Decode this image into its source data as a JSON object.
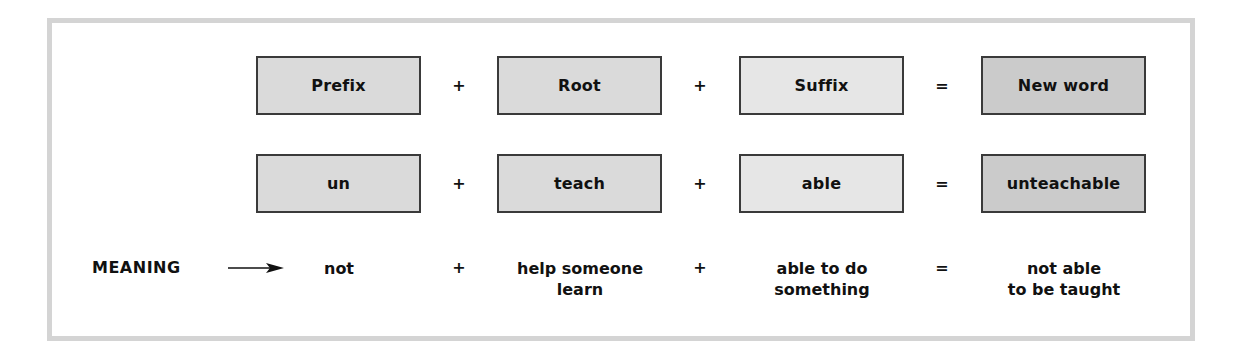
{
  "diagram": {
    "row_headers": [
      {
        "prefix": "Prefix",
        "op1": "+",
        "root": "Root",
        "op2": "+",
        "suffix": "Suffix",
        "op3": "=",
        "result": "New word"
      },
      {
        "prefix": "un",
        "op1": "+",
        "root": "teach",
        "op2": "+",
        "suffix": "able",
        "op3": "=",
        "result": "unteachable"
      }
    ],
    "meaning": {
      "label": "MEANING",
      "prefix_line1": "not",
      "prefix_line2": "",
      "op1": "+",
      "root_line1": "help someone",
      "root_line2": "learn",
      "op2": "+",
      "suffix_line1": "able to do",
      "suffix_line2": "something",
      "op3": "=",
      "result_line1": "not able",
      "result_line2": "to be taught"
    },
    "colors": {
      "prefix_root_fill": "#dadada",
      "suffix_fill": "#e6e6e6",
      "result_fill": "#cbcbcb",
      "frame_border": "#d4d4d4",
      "box_border": "#3a3a3a"
    }
  }
}
